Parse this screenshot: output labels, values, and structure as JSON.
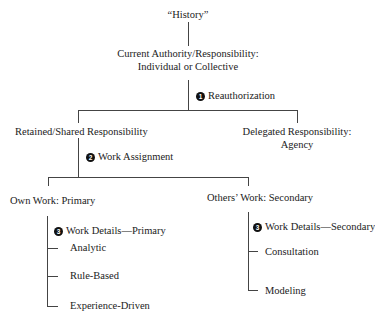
{
  "diagram": {
    "root": {
      "label": "“History”"
    },
    "current": {
      "line1": "Current Authority/Responsibility:",
      "line2": "Individual or Collective"
    },
    "step1": {
      "number": "1",
      "label": "Reauthorization"
    },
    "retained": {
      "label": "Retained/Shared Responsibility"
    },
    "delegated": {
      "line1": "Delegated Responsibility:",
      "line2": "Agency"
    },
    "step2": {
      "number": "2",
      "label": "Work Assignment"
    },
    "own_work": {
      "label": "Own Work: Primary"
    },
    "others_work": {
      "label": "Others’ Work: Secondary"
    },
    "step3_primary": {
      "number": "3",
      "label": "Work Details—Primary"
    },
    "primary_items": [
      "Analytic",
      "Rule-Based",
      "Experience-Driven"
    ],
    "step3_secondary": {
      "number": "3",
      "label": "Work Details—Secondary"
    },
    "secondary_items": [
      "Consultation",
      "Modeling"
    ]
  }
}
